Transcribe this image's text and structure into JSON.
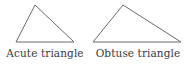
{
  "figures": [
    {
      "id": "acute",
      "label": "Acute triangle",
      "stroke": "#6b6b6b"
    },
    {
      "id": "obtuse",
      "label": "Obtuse triangle",
      "stroke": "#6b6b6b"
    }
  ]
}
